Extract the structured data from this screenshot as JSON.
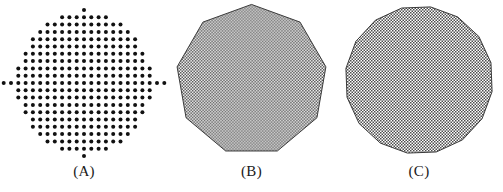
{
  "figure": {
    "background_color": "#ffffff",
    "width": 503,
    "height": 192,
    "ink_color": "#111111",
    "outline_color": "#3a3a3a",
    "halftone_color": "#4d4d4d",
    "halftone_background": "#ffffff",
    "halftone_cell_px": 1.5,
    "halftone_coverage_percent": 50
  },
  "panels": [
    {
      "id": "a",
      "label": "(A)",
      "kind": "dot-matrix-disc",
      "description": "Dots on a square lattice filling a circular region, with isolated single dots at the top, bottom, left and right extremes",
      "dot_diameter_px": 4.0,
      "grid_pitch_px": 7.3,
      "grid_columns": 21,
      "grid_rows": 21,
      "center_x": 84,
      "center_y": 83,
      "row_counts": [
        1,
        7,
        11,
        13,
        15,
        15,
        17,
        17,
        19,
        19,
        21,
        19,
        19,
        17,
        17,
        15,
        15,
        13,
        11,
        7,
        1
      ],
      "isolated_dots": [
        "top",
        "bottom",
        "left",
        "right"
      ],
      "total_dots": 309
    },
    {
      "id": "b",
      "label": "(B)",
      "kind": "polygon",
      "description": "Nine-sided regular polygon with a vertex at the top, filled with a fine checkerboard halftone",
      "sides": 9,
      "radius_px": 76,
      "center_x": 84,
      "center_y": 80,
      "vertex_at_top": true,
      "rotation_deg": -90,
      "outline_width_px": 1.0,
      "fill": "halftone"
    },
    {
      "id": "c",
      "label": "(C)",
      "kind": "polygon",
      "description": "Sixteen-sided polygon closely approximating a circle, filled with the same fine checkerboard halftone",
      "sides": 16,
      "radius_px": 74,
      "center_x": 84,
      "center_y": 80,
      "vertex_at_top": false,
      "rotation_deg": -81,
      "outline_width_px": 1.0,
      "fill": "halftone"
    }
  ]
}
